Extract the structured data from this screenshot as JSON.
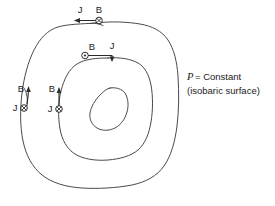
{
  "figure": {
    "name": "isobaric-surface-current-field-diagram",
    "background_color": "#ffffff",
    "contour_color": "#4a4a4a",
    "ink_color": "#2b2b2b"
  },
  "annotation": {
    "line1_symbol": "P",
    "line1_rest": "= Constant",
    "line2": "(isobaric  surface)"
  },
  "markers": {
    "top_outer": {
      "current_label": "J",
      "field_label": "B",
      "current_direction": "left",
      "field_glyph": "into-page"
    },
    "top_inner": {
      "field_label": "B",
      "current_label": "J",
      "current_direction": "right-down",
      "field_glyph": "out-of-page"
    },
    "left_outer": {
      "field_label": "B",
      "current_label": "J",
      "field_direction": "up",
      "current_glyph": "into-page"
    },
    "left_inner": {
      "field_label": "B",
      "current_label": "J",
      "field_direction": "up",
      "current_glyph": "into-page"
    }
  }
}
